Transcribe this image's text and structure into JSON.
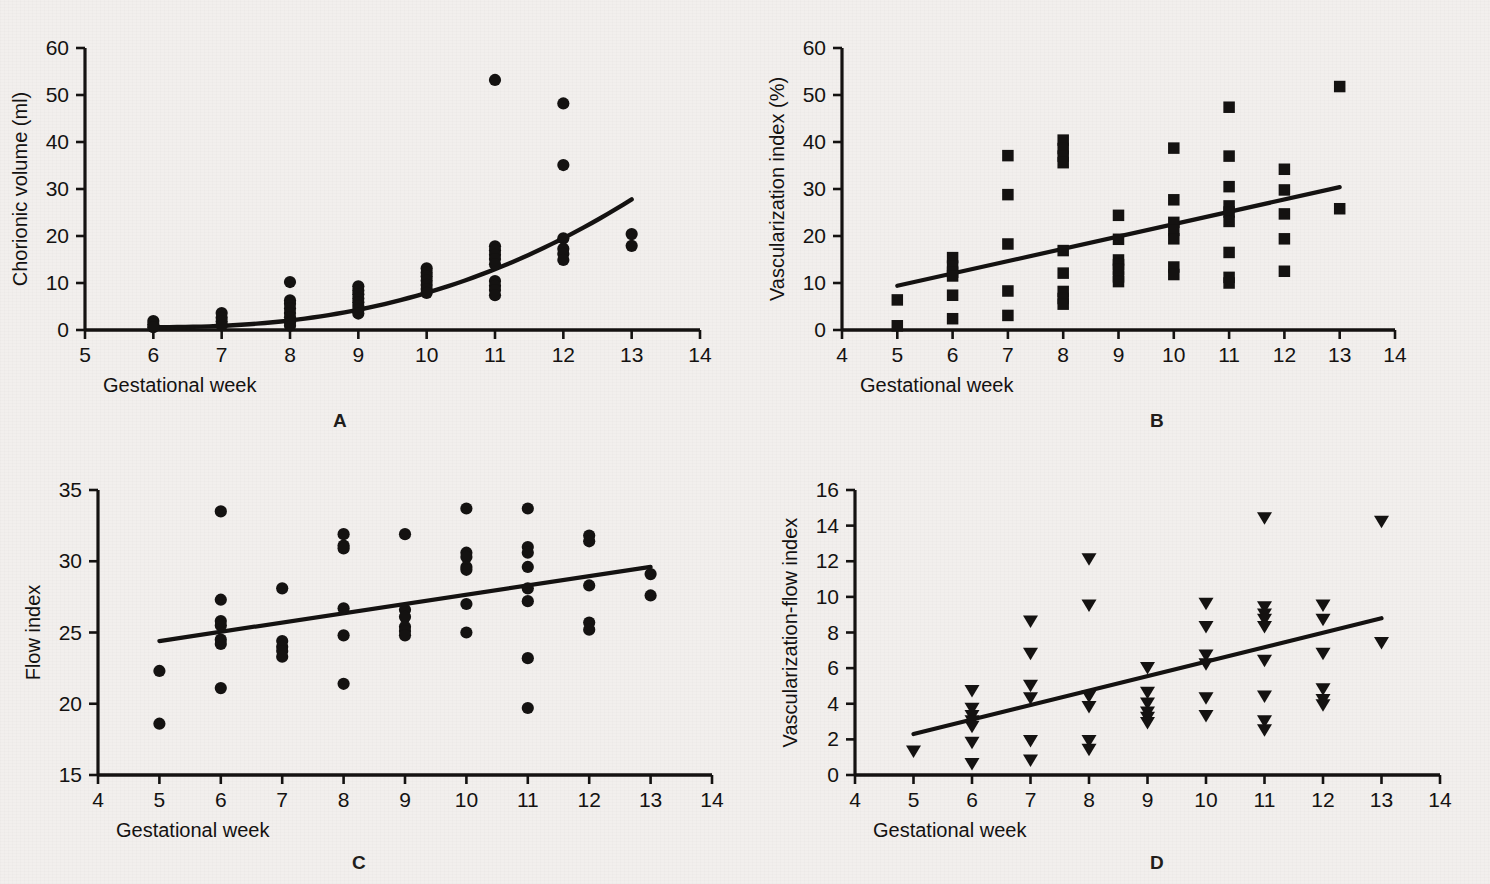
{
  "figure": {
    "background_color": "#f2efed",
    "ink_color": "#141211",
    "panels": [
      "A",
      "B",
      "C",
      "D"
    ]
  },
  "panelA": {
    "letter": "A",
    "xlabel": "Gestational week",
    "ylabel": "Chorionic volume (ml)",
    "xticks": [
      "5",
      "6",
      "7",
      "8",
      "9",
      "10",
      "11",
      "12",
      "13",
      "14"
    ],
    "yticks": [
      "0",
      "10",
      "20",
      "30",
      "40",
      "50",
      "60"
    ]
  },
  "panelB": {
    "letter": "B",
    "xlabel": "Gestational week",
    "ylabel": "Vascularization index (%)",
    "xticks": [
      "4",
      "5",
      "6",
      "7",
      "8",
      "9",
      "10",
      "11",
      "12",
      "13",
      "14"
    ],
    "yticks": [
      "0",
      "10",
      "20",
      "30",
      "40",
      "50",
      "60"
    ]
  },
  "panelC": {
    "letter": "C",
    "xlabel": "Gestational week",
    "ylabel": "Flow index",
    "xticks": [
      "4",
      "5",
      "6",
      "7",
      "8",
      "9",
      "10",
      "11",
      "12",
      "13",
      "14"
    ],
    "yticks": [
      "15",
      "20",
      "25",
      "30",
      "35"
    ]
  },
  "panelD": {
    "letter": "D",
    "xlabel": "Gestational week",
    "ylabel": "Vascularization-flow index",
    "xticks": [
      "4",
      "5",
      "6",
      "7",
      "8",
      "9",
      "10",
      "11",
      "12",
      "13",
      "14"
    ],
    "yticks": [
      "0",
      "2",
      "4",
      "6",
      "8",
      "10",
      "12",
      "14",
      "16"
    ]
  },
  "chart_data": [
    {
      "id": "A",
      "type": "scatter",
      "title": "A",
      "xlabel": "Gestational week",
      "ylabel": "Chorionic volume (ml)",
      "xlim": [
        5,
        14
      ],
      "ylim": [
        0,
        60
      ],
      "xticks": [
        5,
        6,
        7,
        8,
        9,
        10,
        11,
        12,
        13,
        14
      ],
      "yticks": [
        0,
        10,
        20,
        30,
        40,
        50,
        60
      ],
      "grid": false,
      "legend": "none",
      "marker": "filled-circle",
      "points": [
        {
          "x": 6,
          "y": 1.9
        },
        {
          "x": 6,
          "y": 1.2
        },
        {
          "x": 6,
          "y": 0.6
        },
        {
          "x": 7,
          "y": 3.6
        },
        {
          "x": 7,
          "y": 2.6
        },
        {
          "x": 7,
          "y": 1.8
        },
        {
          "x": 7,
          "y": 1.0
        },
        {
          "x": 8,
          "y": 10.2
        },
        {
          "x": 8,
          "y": 6.3
        },
        {
          "x": 8,
          "y": 5.6
        },
        {
          "x": 8,
          "y": 4.6
        },
        {
          "x": 8,
          "y": 3.6
        },
        {
          "x": 8,
          "y": 2.7
        },
        {
          "x": 8,
          "y": 1.6
        },
        {
          "x": 8,
          "y": 0.9
        },
        {
          "x": 9,
          "y": 9.3
        },
        {
          "x": 9,
          "y": 8.4
        },
        {
          "x": 9,
          "y": 7.6
        },
        {
          "x": 9,
          "y": 6.7
        },
        {
          "x": 9,
          "y": 5.9
        },
        {
          "x": 9,
          "y": 5.1
        },
        {
          "x": 9,
          "y": 4.3
        },
        {
          "x": 9,
          "y": 3.5
        },
        {
          "x": 10,
          "y": 13.1
        },
        {
          "x": 10,
          "y": 12.2
        },
        {
          "x": 10,
          "y": 11.4
        },
        {
          "x": 10,
          "y": 10.5
        },
        {
          "x": 10,
          "y": 9.6
        },
        {
          "x": 10,
          "y": 8.7
        },
        {
          "x": 10,
          "y": 7.9
        },
        {
          "x": 11,
          "y": 53.2
        },
        {
          "x": 11,
          "y": 17.8
        },
        {
          "x": 11,
          "y": 16.9
        },
        {
          "x": 11,
          "y": 16.0
        },
        {
          "x": 11,
          "y": 15.1
        },
        {
          "x": 11,
          "y": 14.0
        },
        {
          "x": 11,
          "y": 10.4
        },
        {
          "x": 11,
          "y": 9.4
        },
        {
          "x": 11,
          "y": 8.5
        },
        {
          "x": 11,
          "y": 7.4
        },
        {
          "x": 12,
          "y": 48.2
        },
        {
          "x": 12,
          "y": 35.1
        },
        {
          "x": 12,
          "y": 19.5
        },
        {
          "x": 12,
          "y": 17.3
        },
        {
          "x": 12,
          "y": 16.2
        },
        {
          "x": 12,
          "y": 14.9
        },
        {
          "x": 13,
          "y": 20.4
        },
        {
          "x": 13,
          "y": 17.9
        }
      ],
      "fit": {
        "kind": "exponential-like-curve",
        "x_start": 6,
        "x_end": 13,
        "y_start": 0.6,
        "y_end": 27.8
      }
    },
    {
      "id": "B",
      "type": "scatter",
      "title": "B",
      "xlabel": "Gestational week",
      "ylabel": "Vascularization index (%)",
      "xlim": [
        4,
        14
      ],
      "ylim": [
        0,
        60
      ],
      "xticks": [
        4,
        5,
        6,
        7,
        8,
        9,
        10,
        11,
        12,
        13,
        14
      ],
      "yticks": [
        0,
        10,
        20,
        30,
        40,
        50,
        60
      ],
      "grid": false,
      "legend": "none",
      "marker": "filled-square",
      "points": [
        {
          "x": 5,
          "y": 6.4
        },
        {
          "x": 5,
          "y": 0.9
        },
        {
          "x": 6,
          "y": 15.4
        },
        {
          "x": 6,
          "y": 13.6
        },
        {
          "x": 6,
          "y": 12.3
        },
        {
          "x": 6,
          "y": 11.5
        },
        {
          "x": 6,
          "y": 7.4
        },
        {
          "x": 6,
          "y": 2.4
        },
        {
          "x": 7,
          "y": 37.1
        },
        {
          "x": 7,
          "y": 28.8
        },
        {
          "x": 7,
          "y": 18.3
        },
        {
          "x": 7,
          "y": 8.3
        },
        {
          "x": 7,
          "y": 3.1
        },
        {
          "x": 8,
          "y": 40.4
        },
        {
          "x": 8,
          "y": 38.6
        },
        {
          "x": 8,
          "y": 37.0
        },
        {
          "x": 8,
          "y": 35.6
        },
        {
          "x": 8,
          "y": 16.9
        },
        {
          "x": 8,
          "y": 12.1
        },
        {
          "x": 8,
          "y": 8.2
        },
        {
          "x": 8,
          "y": 6.7
        },
        {
          "x": 8,
          "y": 5.5
        },
        {
          "x": 9,
          "y": 24.4
        },
        {
          "x": 9,
          "y": 19.3
        },
        {
          "x": 9,
          "y": 14.9
        },
        {
          "x": 9,
          "y": 13.9
        },
        {
          "x": 9,
          "y": 12.9
        },
        {
          "x": 9,
          "y": 11.3
        },
        {
          "x": 9,
          "y": 10.3
        },
        {
          "x": 10,
          "y": 38.7
        },
        {
          "x": 10,
          "y": 27.7
        },
        {
          "x": 10,
          "y": 22.9
        },
        {
          "x": 10,
          "y": 21.2
        },
        {
          "x": 10,
          "y": 19.4
        },
        {
          "x": 10,
          "y": 13.4
        },
        {
          "x": 10,
          "y": 11.8
        },
        {
          "x": 11,
          "y": 47.4
        },
        {
          "x": 11,
          "y": 37.0
        },
        {
          "x": 11,
          "y": 30.5
        },
        {
          "x": 11,
          "y": 26.4
        },
        {
          "x": 11,
          "y": 25.1
        },
        {
          "x": 11,
          "y": 23.1
        },
        {
          "x": 11,
          "y": 16.5
        },
        {
          "x": 11,
          "y": 11.2
        },
        {
          "x": 11,
          "y": 10.0
        },
        {
          "x": 12,
          "y": 34.2
        },
        {
          "x": 12,
          "y": 29.8
        },
        {
          "x": 12,
          "y": 24.7
        },
        {
          "x": 12,
          "y": 19.4
        },
        {
          "x": 12,
          "y": 12.5
        },
        {
          "x": 13,
          "y": 51.8
        },
        {
          "x": 13,
          "y": 25.8
        }
      ],
      "fit": {
        "kind": "linear",
        "x_start": 5,
        "x_end": 13,
        "y_start": 9.4,
        "y_end": 30.4
      }
    },
    {
      "id": "C",
      "type": "scatter",
      "title": "C",
      "xlabel": "Gestational week",
      "ylabel": "Flow index",
      "xlim": [
        4,
        14
      ],
      "ylim": [
        15,
        35
      ],
      "xticks": [
        4,
        5,
        6,
        7,
        8,
        9,
        10,
        11,
        12,
        13,
        14
      ],
      "yticks": [
        15,
        20,
        25,
        30,
        35
      ],
      "grid": false,
      "legend": "none",
      "marker": "filled-circle",
      "points": [
        {
          "x": 5,
          "y": 22.3
        },
        {
          "x": 5,
          "y": 18.6
        },
        {
          "x": 6,
          "y": 33.5
        },
        {
          "x": 6,
          "y": 27.3
        },
        {
          "x": 6,
          "y": 25.8
        },
        {
          "x": 6,
          "y": 25.5
        },
        {
          "x": 6,
          "y": 24.5
        },
        {
          "x": 6,
          "y": 24.2
        },
        {
          "x": 6,
          "y": 21.1
        },
        {
          "x": 7,
          "y": 28.1
        },
        {
          "x": 7,
          "y": 24.4
        },
        {
          "x": 7,
          "y": 24.0
        },
        {
          "x": 7,
          "y": 23.7
        },
        {
          "x": 7,
          "y": 23.3
        },
        {
          "x": 8,
          "y": 31.9
        },
        {
          "x": 8,
          "y": 31.1
        },
        {
          "x": 8,
          "y": 30.9
        },
        {
          "x": 8,
          "y": 26.7
        },
        {
          "x": 8,
          "y": 24.8
        },
        {
          "x": 8,
          "y": 21.4
        },
        {
          "x": 9,
          "y": 31.9
        },
        {
          "x": 9,
          "y": 26.6
        },
        {
          "x": 9,
          "y": 26.1
        },
        {
          "x": 9,
          "y": 25.4
        },
        {
          "x": 9,
          "y": 25.1
        },
        {
          "x": 9,
          "y": 24.8
        },
        {
          "x": 10,
          "y": 33.7
        },
        {
          "x": 10,
          "y": 30.6
        },
        {
          "x": 10,
          "y": 30.3
        },
        {
          "x": 10,
          "y": 29.6
        },
        {
          "x": 10,
          "y": 29.4
        },
        {
          "x": 10,
          "y": 27.0
        },
        {
          "x": 10,
          "y": 25.0
        },
        {
          "x": 11,
          "y": 33.7
        },
        {
          "x": 11,
          "y": 31.0
        },
        {
          "x": 11,
          "y": 30.6
        },
        {
          "x": 11,
          "y": 29.6
        },
        {
          "x": 11,
          "y": 28.1
        },
        {
          "x": 11,
          "y": 27.2
        },
        {
          "x": 11,
          "y": 23.2
        },
        {
          "x": 11,
          "y": 19.7
        },
        {
          "x": 12,
          "y": 31.8
        },
        {
          "x": 12,
          "y": 31.4
        },
        {
          "x": 12,
          "y": 28.3
        },
        {
          "x": 12,
          "y": 25.7
        },
        {
          "x": 12,
          "y": 25.2
        },
        {
          "x": 13,
          "y": 29.1
        },
        {
          "x": 13,
          "y": 27.6
        }
      ],
      "fit": {
        "kind": "linear",
        "x_start": 5,
        "x_end": 13,
        "y_start": 24.4,
        "y_end": 29.6
      }
    },
    {
      "id": "D",
      "type": "scatter",
      "title": "D",
      "xlabel": "Gestational week",
      "ylabel": "Vascularization-flow index",
      "xlim": [
        4,
        14
      ],
      "ylim": [
        0,
        16
      ],
      "xticks": [
        4,
        5,
        6,
        7,
        8,
        9,
        10,
        11,
        12,
        13,
        14
      ],
      "yticks": [
        0,
        2,
        4,
        6,
        8,
        10,
        12,
        14,
        16
      ],
      "grid": false,
      "legend": "none",
      "marker": "filled-triangle-down",
      "points": [
        {
          "x": 5,
          "y": 1.3
        },
        {
          "x": 6,
          "y": 4.7
        },
        {
          "x": 6,
          "y": 3.7
        },
        {
          "x": 6,
          "y": 3.3
        },
        {
          "x": 6,
          "y": 3.0
        },
        {
          "x": 6,
          "y": 2.7
        },
        {
          "x": 6,
          "y": 1.8
        },
        {
          "x": 6,
          "y": 0.6
        },
        {
          "x": 7,
          "y": 8.6
        },
        {
          "x": 7,
          "y": 6.8
        },
        {
          "x": 7,
          "y": 5.0
        },
        {
          "x": 7,
          "y": 4.3
        },
        {
          "x": 7,
          "y": 1.9
        },
        {
          "x": 7,
          "y": 0.8
        },
        {
          "x": 8,
          "y": 12.1
        },
        {
          "x": 8,
          "y": 9.5
        },
        {
          "x": 8,
          "y": 4.4
        },
        {
          "x": 8,
          "y": 3.8
        },
        {
          "x": 8,
          "y": 1.9
        },
        {
          "x": 8,
          "y": 1.4
        },
        {
          "x": 9,
          "y": 6.0
        },
        {
          "x": 9,
          "y": 4.6
        },
        {
          "x": 9,
          "y": 4.0
        },
        {
          "x": 9,
          "y": 3.5
        },
        {
          "x": 9,
          "y": 3.2
        },
        {
          "x": 9,
          "y": 2.9
        },
        {
          "x": 10,
          "y": 9.6
        },
        {
          "x": 10,
          "y": 8.3
        },
        {
          "x": 10,
          "y": 6.7
        },
        {
          "x": 10,
          "y": 6.2
        },
        {
          "x": 10,
          "y": 4.3
        },
        {
          "x": 10,
          "y": 3.3
        },
        {
          "x": 11,
          "y": 14.4
        },
        {
          "x": 11,
          "y": 9.4
        },
        {
          "x": 11,
          "y": 9.0
        },
        {
          "x": 11,
          "y": 8.7
        },
        {
          "x": 11,
          "y": 8.3
        },
        {
          "x": 11,
          "y": 6.4
        },
        {
          "x": 11,
          "y": 4.4
        },
        {
          "x": 11,
          "y": 3.0
        },
        {
          "x": 11,
          "y": 2.5
        },
        {
          "x": 12,
          "y": 9.5
        },
        {
          "x": 12,
          "y": 8.7
        },
        {
          "x": 12,
          "y": 6.8
        },
        {
          "x": 12,
          "y": 4.8
        },
        {
          "x": 12,
          "y": 4.2
        },
        {
          "x": 12,
          "y": 3.9
        },
        {
          "x": 13,
          "y": 14.2
        },
        {
          "x": 13,
          "y": 7.4
        }
      ],
      "fit": {
        "kind": "linear",
        "x_start": 5,
        "x_end": 13,
        "y_start": 2.3,
        "y_end": 8.8
      }
    }
  ]
}
